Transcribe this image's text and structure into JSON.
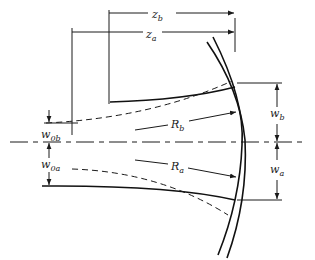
{
  "figure": {
    "type": "optics beam-mode matching diagram",
    "colors": {
      "ink": "#1a1a1a",
      "background": "#ffffff"
    },
    "labels": {
      "z_b": {
        "base": "z",
        "sub": "b"
      },
      "z_a": {
        "base": "z",
        "sub": "a"
      },
      "w_0b": {
        "base": "w",
        "sub": "0b"
      },
      "w_0a": {
        "base": "w",
        "sub": "0a"
      },
      "R_b": {
        "base": "R",
        "sub": "b"
      },
      "R_a": {
        "base": "R",
        "sub": "a"
      },
      "w_b": {
        "base": "w",
        "sub": "b"
      },
      "w_a": {
        "base": "w",
        "sub": "a"
      }
    }
  }
}
